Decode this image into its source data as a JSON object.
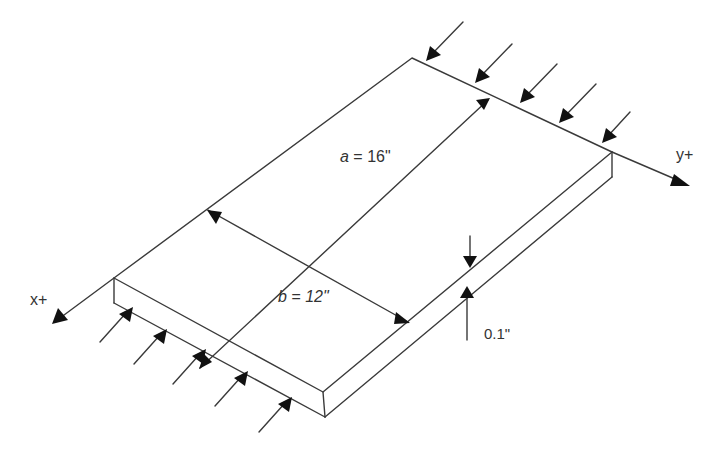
{
  "figure": {
    "axes": {
      "x_label": "x+",
      "y_label": "y+"
    },
    "dimensions": {
      "a": {
        "var": "a",
        "text": " = 16\""
      },
      "b": {
        "var": "b",
        "text": " = 12\""
      },
      "thickness": {
        "text": "0.1\""
      }
    },
    "loads": {
      "back_edge_arrow_count": 5,
      "front_edge_arrow_count": 5,
      "type": "compressive"
    },
    "colors": {
      "line": "#3a3a3a",
      "arrowhead": "#111111",
      "background": "#ffffff"
    }
  }
}
